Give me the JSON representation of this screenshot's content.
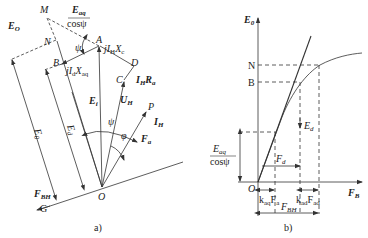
{
  "figure": {
    "panels": [
      {
        "id": "a",
        "caption": "a)",
        "points": {
          "M": "M",
          "N": "N",
          "A": "A",
          "B": "B",
          "C": "C",
          "D": "D",
          "O": "O",
          "P": "P",
          "G": "G"
        },
        "labels": {
          "E0_top": {
            "main": "E",
            "sub": "O"
          },
          "Eaq_frac_num": {
            "main": "E",
            "sub": "aq"
          },
          "Eaq_frac_den": "cosψ",
          "psi_top": "ψ",
          "jIHXc": {
            "pre": "jI",
            "sub1": "H",
            "mid": "X",
            "sub2": "c"
          },
          "jIdXaq": {
            "pre": "jI",
            "sub1": "d",
            "mid": "X",
            "sub2": "aq"
          },
          "IHRa": {
            "pre": "I",
            "sub1": "H",
            "mid": "R",
            "sub2": "a"
          },
          "Ei": {
            "main": "E",
            "sub": "i"
          },
          "UH": {
            "main": "U",
            "sub": "H"
          },
          "psi_mid": "ψ",
          "phi": "φ",
          "IH": {
            "main": "I",
            "sub": "H"
          },
          "Fa": {
            "main": "F",
            "sub": "a"
          },
          "E0_side": {
            "main": "E",
            "sub": "0"
          },
          "Ed_side": {
            "main": "E",
            "sub": "d"
          },
          "FBH": {
            "main": "F",
            "sub": "BH"
          }
        }
      },
      {
        "id": "b",
        "caption": "b)",
        "axes": {
          "y_label": {
            "main": "E",
            "sub": "0"
          },
          "x_label": {
            "main": "F",
            "sub": "B"
          },
          "origin": "O"
        },
        "ticks": {
          "N": "N",
          "B": "B"
        },
        "labels": {
          "Ed": {
            "main": "E",
            "sub": "d"
          },
          "Eaq_frac_num": {
            "main": "E",
            "sub": "aq"
          },
          "Eaq_frac_den": "cosψ",
          "Fd": {
            "main": "F",
            "sub": "d"
          },
          "kaqFa": {
            "k": "k",
            "ksub": "aq",
            "F": "F",
            "Fsub": "a"
          },
          "kadFad": {
            "k": "k",
            "ksub": "ad",
            "F": "F",
            "Fsub": "ad"
          },
          "FBH": {
            "main": "F",
            "sub": "BH"
          }
        }
      }
    ]
  },
  "colors": {
    "line": "#333333",
    "text": "#222222",
    "background": "#ffffff"
  }
}
